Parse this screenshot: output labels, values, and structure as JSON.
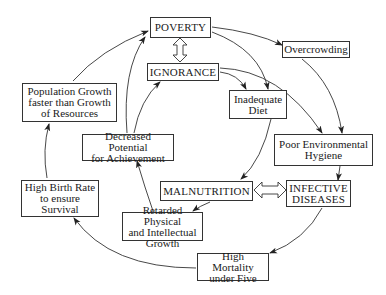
{
  "diagram": {
    "nodes": {
      "poverty": "POVERTY",
      "ignorance": "IGNORANCE",
      "overcrowding": "Overcrowding",
      "inadequate_diet": "Inadequate\nDiet",
      "poor_hygiene": "Poor Environmental\nHygiene",
      "population_growth": "Population Growth\nfaster than Growth\nof Resources",
      "decreased_potential": "Decreased Potential\nfor Achievement",
      "high_birth_rate": "High Birth Rate\nto ensure\nSurvival",
      "malnutrition": "MALNUTRITION",
      "infective_diseases": "INFECTIVE\nDISEASES",
      "retarded_growth": "Retarded Physical\nand Intellectual\nGrowth",
      "high_mortality": "High Mortality\nunder Five"
    },
    "edges": [
      {
        "from": "poverty",
        "to": "ignorance",
        "type": "bidirectional"
      },
      {
        "from": "poverty",
        "to": "overcrowding"
      },
      {
        "from": "poverty",
        "to": "inadequate_diet"
      },
      {
        "from": "ignorance",
        "to": "inadequate_diet"
      },
      {
        "from": "ignorance",
        "to": "poor_hygiene"
      },
      {
        "from": "overcrowding",
        "to": "poor_hygiene"
      },
      {
        "from": "inadequate_diet",
        "to": "malnutrition"
      },
      {
        "from": "poor_hygiene",
        "to": "infective_diseases"
      },
      {
        "from": "malnutrition",
        "to": "infective_diseases",
        "type": "bidirectional"
      },
      {
        "from": "malnutrition",
        "to": "retarded_growth"
      },
      {
        "from": "infective_diseases",
        "to": "high_mortality"
      },
      {
        "from": "retarded_growth",
        "to": "decreased_potential"
      },
      {
        "from": "decreased_potential",
        "to": "ignorance"
      },
      {
        "from": "decreased_potential",
        "to": "poverty"
      },
      {
        "from": "high_mortality",
        "to": "high_birth_rate"
      },
      {
        "from": "high_birth_rate",
        "to": "population_growth"
      },
      {
        "from": "population_growth",
        "to": "poverty"
      }
    ]
  }
}
